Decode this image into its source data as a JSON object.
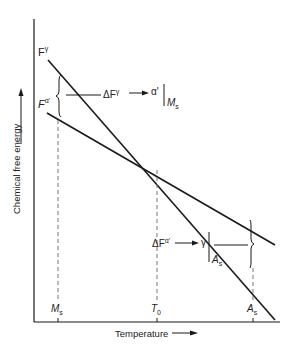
{
  "diagram": {
    "axes": {
      "y_label": "Chemical free energy",
      "x_label": "Temperature"
    },
    "curves": [
      {
        "name": "F^γ",
        "base": "F",
        "superscript": "γ"
      },
      {
        "name": "F^α'",
        "base": "F",
        "superscript": "α'"
      }
    ],
    "x_ticks": [
      {
        "base": "M",
        "sub": "s"
      },
      {
        "base": "T",
        "sub": "0"
      },
      {
        "base": "A",
        "sub": "s"
      }
    ],
    "annotations": {
      "upper": {
        "delta": "ΔF",
        "sup": "γ",
        "arrow": "⟶",
        "product": "α'",
        "at_base": "M",
        "at_sub": "s"
      },
      "lower": {
        "delta": "ΔF",
        "sup": "α'",
        "arrow": "⟶",
        "product": "γ",
        "at_base": "A",
        "at_sub": "s"
      }
    },
    "colors": {
      "line": "#1a1a1a",
      "dashed": "#777777"
    }
  }
}
